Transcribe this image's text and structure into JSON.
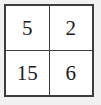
{
  "table": {
    "rows": [
      {
        "cells": [
          "5",
          "2"
        ]
      },
      {
        "cells": [
          "15",
          "6"
        ]
      }
    ],
    "border_color": "#3d3d3d",
    "cell_background": "#ffffff",
    "text_color": "#1a1a1a",
    "page_background": "#f1f1f1",
    "columns": 2,
    "row_count": 2
  }
}
